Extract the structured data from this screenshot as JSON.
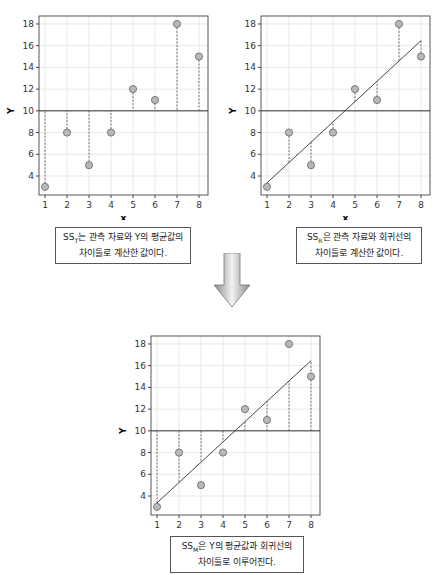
{
  "chart_data": [
    {
      "type": "scatter",
      "title": "",
      "xlabel": "x",
      "ylabel": "Y",
      "x": [
        1,
        2,
        3,
        4,
        5,
        6,
        7,
        8
      ],
      "y": [
        3,
        8,
        5,
        8,
        12,
        11,
        18,
        15
      ],
      "mean_line": 10,
      "regression": null,
      "residuals_to": "mean",
      "xticks": [
        1,
        2,
        3,
        4,
        5,
        6,
        7,
        8
      ],
      "yticks": [
        4,
        6,
        8,
        10,
        12,
        14,
        16,
        18
      ],
      "xlim": [
        0.9,
        8.3
      ],
      "ylim": [
        2.3,
        18.8
      ],
      "grid": true
    },
    {
      "type": "scatter",
      "title": "",
      "xlabel": "x",
      "ylabel": "Y",
      "x": [
        1,
        2,
        3,
        4,
        5,
        6,
        7,
        8
      ],
      "y": [
        3,
        8,
        5,
        8,
        12,
        11,
        18,
        15
      ],
      "mean_line": 10,
      "regression": {
        "intercept": 1.5,
        "slope": 1.87
      },
      "residuals_to": "regression",
      "xticks": [
        1,
        2,
        3,
        4,
        5,
        6,
        7,
        8
      ],
      "yticks": [
        4,
        6,
        8,
        10,
        12,
        14,
        16,
        18
      ],
      "xlim": [
        0.9,
        8.3
      ],
      "ylim": [
        2.3,
        18.8
      ],
      "grid": true
    },
    {
      "type": "scatter",
      "title": "",
      "xlabel": "x",
      "ylabel": "Y",
      "x": [
        1,
        2,
        3,
        4,
        5,
        6,
        7,
        8
      ],
      "y": [
        3,
        8,
        5,
        8,
        12,
        11,
        18,
        15
      ],
      "mean_line": 10,
      "regression": {
        "intercept": 1.5,
        "slope": 1.87
      },
      "residuals_to": "mean_vs_regression",
      "xticks": [
        1,
        2,
        3,
        4,
        5,
        6,
        7,
        8
      ],
      "yticks": [
        4,
        6,
        8,
        10,
        12,
        14,
        16,
        18
      ],
      "xlim": [
        0.9,
        8.3
      ],
      "ylim": [
        2.3,
        18.8
      ],
      "grid": true
    }
  ],
  "captions": {
    "sst": {
      "prefix": "SS",
      "sub": "T",
      "line1_rest": "는 관측 자료와 Y의 평균값의",
      "line2": "차이들로 계산한 값이다."
    },
    "ssr": {
      "prefix": "SS",
      "sub": "R",
      "line1_rest": "은 관측 자료와 회귀선의",
      "line2": "차이들로 계산한 값이다."
    },
    "ssm": {
      "prefix": "SS",
      "sub": "M",
      "line1_rest": "은 Y의 평균값과 회귀선의",
      "line2": "차이들로 이루어진다."
    }
  },
  "colors": {
    "point_fill": "#b8b8b8",
    "point_stroke": "#666666",
    "line": "#333333",
    "grid": "#e2e2e2",
    "arrow": "#b0b0b0"
  }
}
